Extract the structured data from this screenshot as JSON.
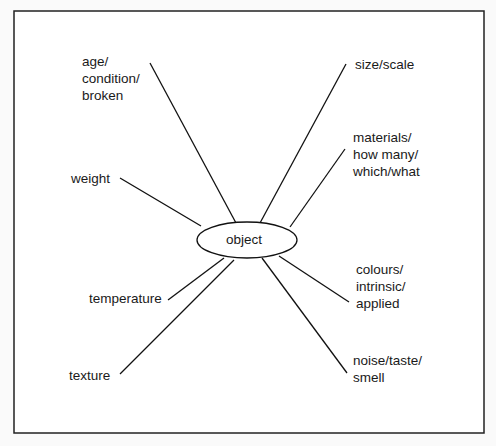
{
  "diagram": {
    "center": "object",
    "labels": [
      {
        "text": "age/\ncondition/\nbroken",
        "x": 82,
        "y": 53
      },
      {
        "text": "size/scale",
        "x": 355,
        "y": 56
      },
      {
        "text": "materials/\nhow many/\nwhich/what",
        "x": 353,
        "y": 129
      },
      {
        "text": "weight",
        "x": 71,
        "y": 170
      },
      {
        "text": "colours/\nintrinsic/\napplied",
        "x": 356,
        "y": 261
      },
      {
        "text": "temperature",
        "x": 89,
        "y": 290
      },
      {
        "text": "texture",
        "x": 69,
        "y": 367
      },
      {
        "text": "noise/taste/\nsmell",
        "x": 353,
        "y": 352
      }
    ]
  }
}
